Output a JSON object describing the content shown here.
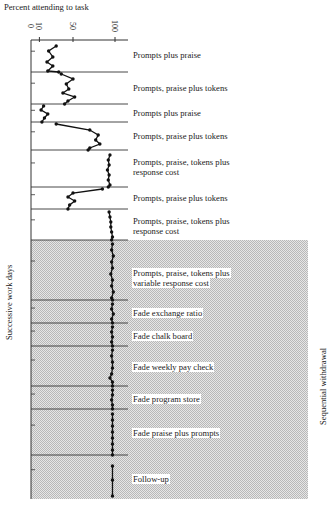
{
  "chart_data": {
    "type": "line",
    "orientation": "rotated-vertical-time",
    "title": "Percent attending to task",
    "xlabel": "Percent attending to task",
    "ylabel": "Successive work days",
    "right_label": "Sequential withdrawal",
    "value_ticks": [
      "0",
      "10",
      "50",
      "100"
    ],
    "value_range": [
      0,
      100
    ],
    "grid": false,
    "shaded_region": {
      "from_phase": 7,
      "to_phase": 13,
      "label": "Sequential withdrawal"
    },
    "phases": [
      {
        "label": "Prompts plus praise",
        "y0": 40,
        "y1": 72,
        "points": [
          [
            46,
            30
          ],
          [
            51,
            21
          ],
          [
            57,
            26
          ],
          [
            62,
            19
          ],
          [
            66,
            26
          ],
          [
            71,
            20
          ],
          [
            72,
            33
          ]
        ]
      },
      {
        "label": "Prompts, praise plus tokens",
        "y0": 72,
        "y1": 104,
        "points": [
          [
            74,
            36
          ],
          [
            79,
            50
          ],
          [
            84,
            42
          ],
          [
            89,
            45
          ],
          [
            93,
            38
          ],
          [
            97,
            52
          ],
          [
            101,
            44
          ],
          [
            104,
            40
          ]
        ]
      },
      {
        "label": "Prompts plus praise",
        "y0": 104,
        "y1": 122,
        "points": [
          [
            106,
            15
          ],
          [
            110,
            12
          ],
          [
            114,
            20
          ],
          [
            118,
            16
          ],
          [
            122,
            13
          ]
        ]
      },
      {
        "label": "Prompts, praise plus tokens",
        "y0": 122,
        "y1": 150,
        "points": [
          [
            124,
            30
          ],
          [
            130,
            70
          ],
          [
            135,
            80
          ],
          [
            140,
            77
          ],
          [
            144,
            82
          ],
          [
            148,
            70
          ],
          [
            150,
            68
          ]
        ]
      },
      {
        "label": "Prompts, praise, tokens plus response cost",
        "y0": 150,
        "y1": 187,
        "points": [
          [
            155,
            94
          ],
          [
            160,
            92
          ],
          [
            165,
            93
          ],
          [
            170,
            91
          ],
          [
            175,
            93
          ],
          [
            180,
            92
          ],
          [
            185,
            94
          ],
          [
            187,
            92
          ]
        ]
      },
      {
        "label": "Prompts, praise plus tokens",
        "y0": 187,
        "y1": 209,
        "points": [
          [
            189,
            85
          ],
          [
            193,
            50
          ],
          [
            197,
            44
          ],
          [
            201,
            52
          ],
          [
            205,
            46
          ],
          [
            209,
            44
          ]
        ]
      },
      {
        "label": "Prompts, praise, tokens plus response cost",
        "y0": 209,
        "y1": 240,
        "points": [
          [
            212,
            93
          ],
          [
            217,
            94
          ],
          [
            222,
            95
          ],
          [
            227,
            95
          ],
          [
            232,
            96
          ],
          [
            237,
            97
          ],
          [
            240,
            96
          ]
        ]
      },
      {
        "label": "Prompts, praise, tokens plus variable response cost",
        "y0": 240,
        "y1": 300,
        "points": [
          [
            244,
            97
          ],
          [
            250,
            96
          ],
          [
            256,
            98
          ],
          [
            262,
            96
          ],
          [
            268,
            97
          ],
          [
            274,
            95
          ],
          [
            280,
            97
          ],
          [
            286,
            96
          ],
          [
            292,
            98
          ],
          [
            298,
            96
          ],
          [
            300,
            97
          ]
        ]
      },
      {
        "label": "Fade exchange ratio",
        "y0": 300,
        "y1": 323,
        "points": [
          [
            304,
            97
          ],
          [
            309,
            96
          ],
          [
            314,
            98
          ],
          [
            319,
            96
          ],
          [
            323,
            97
          ]
        ]
      },
      {
        "label": "Fade chalk board",
        "y0": 323,
        "y1": 346,
        "points": [
          [
            327,
            97
          ],
          [
            332,
            96
          ],
          [
            337,
            97
          ],
          [
            342,
            96
          ],
          [
            346,
            97
          ]
        ]
      },
      {
        "label": "Fade weekly pay check",
        "y0": 346,
        "y1": 386,
        "points": [
          [
            350,
            97
          ],
          [
            356,
            96
          ],
          [
            362,
            97
          ],
          [
            368,
            97
          ],
          [
            374,
            96
          ],
          [
            378,
            94
          ],
          [
            382,
            97
          ],
          [
            386,
            97
          ]
        ]
      },
      {
        "label": "Fade program store",
        "y0": 386,
        "y1": 409,
        "points": [
          [
            390,
            97
          ],
          [
            395,
            97
          ],
          [
            400,
            96
          ],
          [
            405,
            97
          ],
          [
            409,
            97
          ]
        ]
      },
      {
        "label": "Fade praise plus prompts",
        "y0": 409,
        "y1": 455,
        "points": [
          [
            414,
            97
          ],
          [
            420,
            97
          ],
          [
            426,
            97
          ],
          [
            432,
            97
          ],
          [
            438,
            97
          ],
          [
            444,
            97
          ],
          [
            450,
            97
          ],
          [
            455,
            97
          ]
        ]
      },
      {
        "label": "Follow-up",
        "y0": 455,
        "y1": 497,
        "points": [
          [
            466,
            97
          ],
          [
            480,
            97
          ],
          [
            496,
            97
          ]
        ]
      }
    ],
    "label_positions": [
      {
        "text": "Prompts plus praise",
        "x": 132,
        "y": 50
      },
      {
        "text": "Prompts, praise plus tokens",
        "x": 132,
        "y": 83
      },
      {
        "text": "Prompts plus praise",
        "x": 132,
        "y": 108
      },
      {
        "text": "Prompts, praise plus tokens",
        "x": 132,
        "y": 131
      },
      {
        "text": "Prompts, praise, tokens plus",
        "x": 132,
        "y": 157
      },
      {
        "text": "response cost",
        "x": 132,
        "y": 167
      },
      {
        "text": "Prompts, praise plus tokens",
        "x": 132,
        "y": 193
      },
      {
        "text": "Prompts, praise, tokens plus",
        "x": 132,
        "y": 216
      },
      {
        "text": "response cost",
        "x": 132,
        "y": 226
      },
      {
        "text": "Prompts, praise, tokens plus",
        "x": 132,
        "y": 268
      },
      {
        "text": "variable response cost",
        "x": 132,
        "y": 278
      },
      {
        "text": "Fade exchange ratio",
        "x": 132,
        "y": 308
      },
      {
        "text": "Fade chalk board",
        "x": 132,
        "y": 331
      },
      {
        "text": "Fade weekly pay check",
        "x": 132,
        "y": 362
      },
      {
        "text": "Fade program store",
        "x": 132,
        "y": 394
      },
      {
        "text": "Fade praise plus prompts",
        "x": 132,
        "y": 428
      },
      {
        "text": "Follow-up",
        "x": 132,
        "y": 474
      }
    ]
  }
}
